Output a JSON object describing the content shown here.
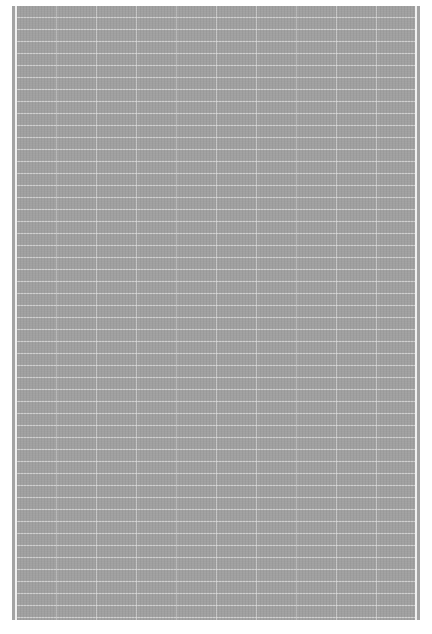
{
  "document": {
    "description": "Dense gridded page rendered at very low resolution; no text is legible",
    "colors": {
      "page_gray": "#a3a3a3",
      "grid_line": "#ebebeb",
      "border": "#f0f0f0",
      "background": "#ffffff"
    },
    "grid": {
      "approx_row_height_px": 12,
      "approx_column_width_px": 40,
      "approx_rows": 51,
      "approx_columns": 10
    },
    "text": ""
  }
}
